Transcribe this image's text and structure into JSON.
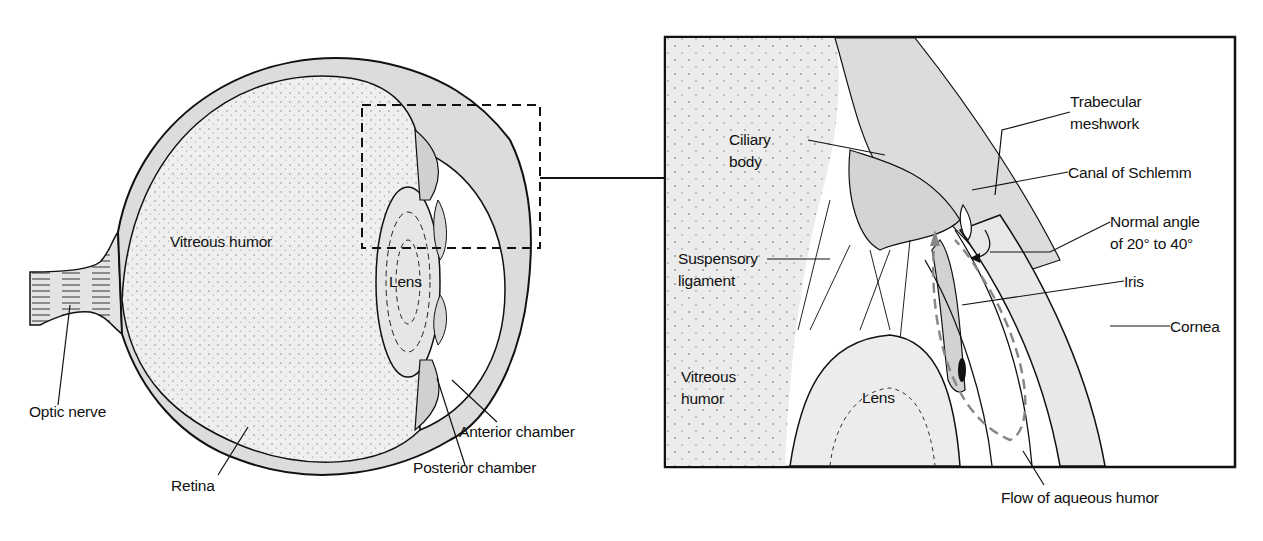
{
  "overview": {
    "labels": {
      "vitreous_humor": "Vitreous humor",
      "lens": "Lens",
      "optic_nerve": "Optic nerve",
      "retina": "Retina",
      "anterior_chamber": "Anterior chamber",
      "posterior_chamber": "Posterior chamber"
    }
  },
  "detail": {
    "labels": {
      "ciliary_body_1": "Ciliary",
      "ciliary_body_2": "body",
      "trabecular_1": "Trabecular",
      "trabecular_2": "meshwork",
      "canal": "Canal of Schlemm",
      "angle_1": "Normal angle",
      "angle_2": "of 20° to 40°",
      "suspensory_1": "Suspensory",
      "suspensory_2": "ligament",
      "iris": "Iris",
      "cornea": "Cornea",
      "vitreous_1": "Vitreous",
      "vitreous_2": "humor",
      "lens": "Lens",
      "flow": "Flow of aqueous humor"
    }
  },
  "colors": {
    "tissue_fill": "#e2e2e2",
    "vitreous_fill": "#eeeeee",
    "stroke": "#111111",
    "flow_dash": "#888888"
  }
}
